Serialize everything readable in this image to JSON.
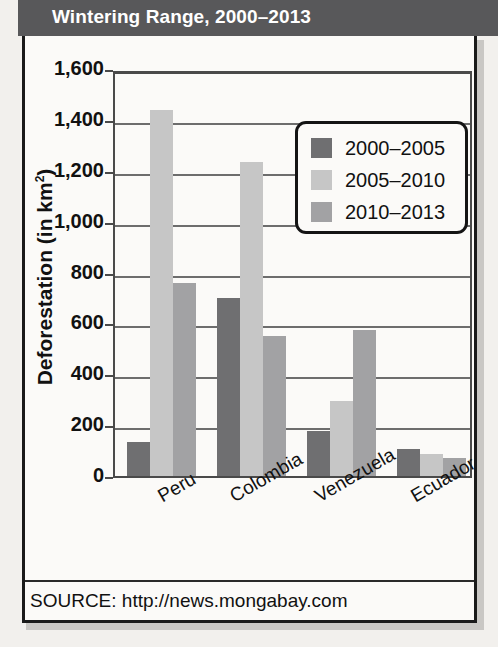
{
  "header": {
    "title": "Wintering Range, 2000–2013"
  },
  "source": {
    "label": "SOURCE: http://news.mongabay.com"
  },
  "legend": {
    "entries": [
      {
        "label": "2000–2005",
        "color": "#6f6f71"
      },
      {
        "label": "2005–2010",
        "color": "#c6c6c6"
      },
      {
        "label": "2010–2013",
        "color": "#a2a2a4"
      }
    ]
  },
  "axes": {
    "y_title_main": "Deforestation (in km",
    "y_title_sup": "2",
    "y_title_tail": ")",
    "y_ticks": [
      "1,600",
      "1,400",
      "1,200",
      "1,000",
      "800",
      "600",
      "400",
      "200",
      "0"
    ]
  },
  "chart_data": {
    "type": "bar",
    "title": "Wintering Range, 2000–2013",
    "xlabel": "",
    "ylabel": "Deforestation (in km²)",
    "ylim": [
      0,
      1600
    ],
    "ytick_step": 200,
    "grid": true,
    "legend_position": "upper-right-inside",
    "categories": [
      "Peru",
      "Colombia",
      "Venezuela",
      "Ecuador"
    ],
    "series": [
      {
        "name": "2000–2005",
        "color": "#6f6f71",
        "values": [
          135,
          700,
          175,
          105
        ]
      },
      {
        "name": "2005–2010",
        "color": "#c6c6c6",
        "values": [
          1440,
          1235,
          295,
          85
        ]
      },
      {
        "name": "2010–2013",
        "color": "#a2a2a4",
        "values": [
          760,
          550,
          575,
          70
        ]
      }
    ],
    "source": "SOURCE: http://news.mongabay.com"
  }
}
